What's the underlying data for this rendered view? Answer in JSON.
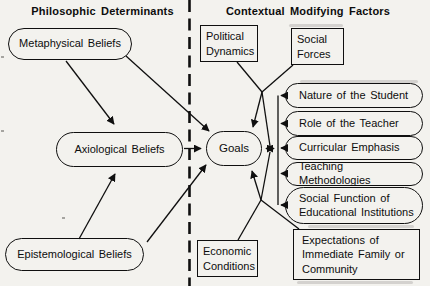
{
  "headers": {
    "left": "Philosophic Determinants",
    "right": "Contextual Modifying Factors"
  },
  "philosophic": {
    "metaphysical": "Metaphysical Beliefs",
    "axiological": "Axiological Beliefs",
    "epistemological": "Epistemological Beliefs"
  },
  "center": {
    "goals": "Goals"
  },
  "contextual": {
    "political_dynamics": "Political Dynamics",
    "social_forces": "Social Forces",
    "economic_conditions": "Economic Conditions",
    "expectations": "Expectations of Immediate Family or Community",
    "factors": [
      "Nature of the Student",
      "Role of the Teacher",
      "Curricular Emphasis",
      "Teaching Methodologies",
      "Social Function of Educational Institutions"
    ]
  },
  "edges": [
    {
      "from": "metaphysical-beliefs",
      "to": "axiological-beliefs",
      "style": "arrow"
    },
    {
      "from": "metaphysical-beliefs",
      "to": "goals",
      "style": "arrow"
    },
    {
      "from": "epistemological-beliefs",
      "to": "axiological-beliefs",
      "style": "arrow"
    },
    {
      "from": "epistemological-beliefs",
      "to": "goals",
      "style": "arrow"
    },
    {
      "from": "axiological-beliefs",
      "to": "goals",
      "style": "arrow"
    },
    {
      "from": "political-dynamics",
      "to": "goals",
      "style": "arrow-converging"
    },
    {
      "from": "social-forces",
      "to": "goals",
      "style": "arrow-converging"
    },
    {
      "from": "economic-conditions",
      "to": "goals",
      "style": "arrow-converging"
    },
    {
      "from": "expectations-family-community",
      "to": "goals",
      "style": "arrow-converging"
    },
    {
      "from": "goals",
      "to": "factor-bus",
      "style": "double-arrow"
    },
    {
      "from": "nature-of-the-student",
      "to": "factor-bus",
      "style": "arrow"
    },
    {
      "from": "role-of-the-teacher",
      "to": "factor-bus",
      "style": "arrow"
    },
    {
      "from": "curricular-emphasis",
      "to": "factor-bus",
      "style": "arrow"
    },
    {
      "from": "teaching-methodologies",
      "to": "factor-bus",
      "style": "arrow"
    },
    {
      "from": "social-function-educational-institutions",
      "to": "factor-bus",
      "style": "arrow"
    }
  ],
  "colors": {
    "ink": "#0f0f0f",
    "paper": "#f3f2ee"
  }
}
